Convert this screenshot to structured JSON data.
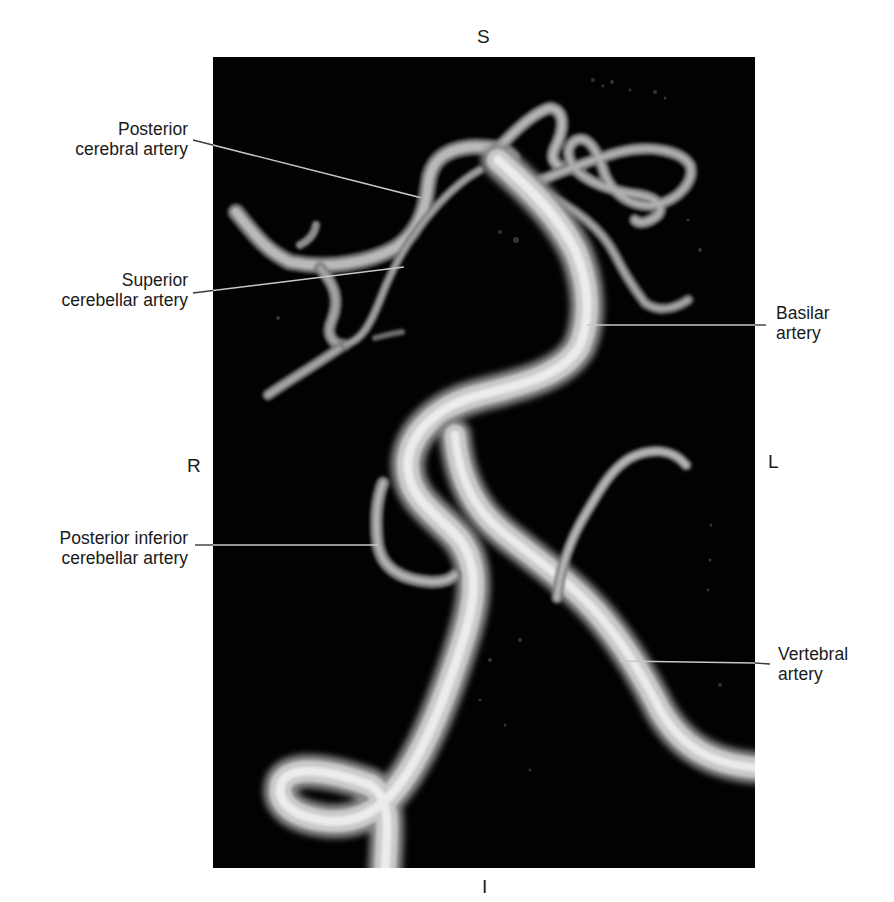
{
  "figure": {
    "orientation": {
      "superior": "S",
      "inferior": "I",
      "right": "R",
      "left": "L"
    },
    "labels": {
      "posterior_cerebral": {
        "line1": "Posterior",
        "line2": "cerebral artery"
      },
      "superior_cerebellar": {
        "line1": "Superior",
        "line2": "cerebellar artery"
      },
      "basilar": {
        "line1": "Basilar",
        "line2": "artery"
      },
      "posterior_inferior_cerebellar": {
        "line1": "Posterior inferior",
        "line2": "cerebellar artery"
      },
      "vertebral": {
        "line1": "Vertebral",
        "line2": "artery"
      }
    },
    "colors": {
      "background": "#ffffff",
      "scan_background": "#020202",
      "vessel_highlight": "#e8e8e8",
      "vessel_shadow": "#7a7a7a",
      "leader_line": "#c8c8c8",
      "text": "#1a1a1a"
    }
  }
}
